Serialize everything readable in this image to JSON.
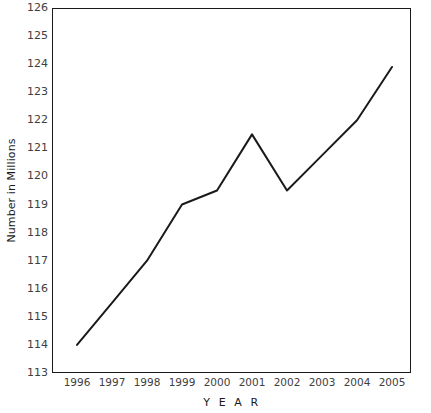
{
  "chart_data": {
    "type": "line",
    "title": "",
    "xlabel": "Y E A R",
    "ylabel": "Number in Millions",
    "categories": [
      "1996",
      "1997",
      "1998",
      "1999",
      "2000",
      "2001",
      "2002",
      "2003",
      "2004",
      "2005"
    ],
    "x": [
      1996,
      1997,
      1998,
      1999,
      2000,
      2001,
      2002,
      2003,
      2004,
      2005
    ],
    "values": [
      114.0,
      115.5,
      117.0,
      119.0,
      119.5,
      121.5,
      119.5,
      120.75,
      122.0,
      123.9
    ],
    "series": [
      {
        "name": "Number in Millions",
        "values": [
          114.0,
          115.5,
          117.0,
          119.0,
          119.5,
          121.5,
          119.5,
          120.75,
          122.0,
          123.9
        ]
      }
    ],
    "ylim": [
      113,
      126
    ],
    "xlim": [
      1995.5,
      2005.5
    ],
    "yticks": [
      113,
      114,
      115,
      116,
      117,
      118,
      119,
      120,
      121,
      122,
      123,
      124,
      125,
      126
    ],
    "ytick_labels": [
      "113",
      "114",
      "115",
      "116",
      "117",
      "118",
      "119",
      "120",
      "121",
      "122",
      "123",
      "124",
      "125",
      "126"
    ],
    "xtick_labels": [
      "1996",
      "1997",
      "1998",
      "1999",
      "2000",
      "2001",
      "2002",
      "2003",
      "2004",
      "2005"
    ],
    "grid": false,
    "legend": false,
    "legend_position": "none",
    "line_color": "#1a1a1a",
    "line_width": 2,
    "markers": false,
    "frame_color": "#1a1a1a",
    "background_color": "#ffffff",
    "tick_label_color": "#404040",
    "axis_title_color": "#1a1a1a"
  }
}
